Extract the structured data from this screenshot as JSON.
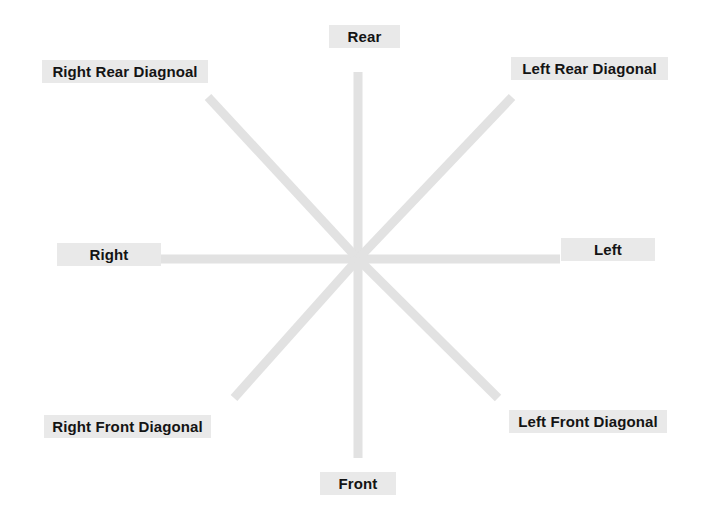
{
  "diagram": {
    "type": "eight-direction-axis-diagram",
    "center": {
      "x": 358,
      "y": 259
    },
    "line_color": "#e2e2e2",
    "label_background": "#e9e9e9",
    "label_text_color": "#141414",
    "background": "#ffffff",
    "axes": [
      {
        "name": "vertical",
        "x1": 358,
        "y1": 72,
        "x2": 358,
        "y2": 458
      },
      {
        "name": "horizontal",
        "x1": 158,
        "y1": 259,
        "x2": 560,
        "y2": 259
      },
      {
        "name": "rear-left-diagonal",
        "x1": 358,
        "y1": 259,
        "x2": 512,
        "y2": 97
      },
      {
        "name": "rear-right-diagonal",
        "x1": 358,
        "y1": 259,
        "x2": 208,
        "y2": 97
      },
      {
        "name": "front-left-diagonal",
        "x1": 358,
        "y1": 259,
        "x2": 498,
        "y2": 398
      },
      {
        "name": "front-right-diagonal",
        "x1": 358,
        "y1": 259,
        "x2": 234,
        "y2": 398
      }
    ],
    "labels": {
      "rear": "Rear",
      "right_rear_diagonal": "Right Rear Diagnoal",
      "left_rear_diagonal": "Left Rear Diagonal",
      "right": "Right",
      "left": "Left",
      "right_front_diagonal": "Right Front Diagonal",
      "left_front_diagonal": "Left Front Diagonal",
      "front": "Front"
    }
  }
}
